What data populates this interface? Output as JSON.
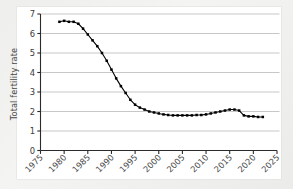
{
  "chart_data": {
    "type": "line",
    "title": "",
    "xlabel": "",
    "ylabel": "Total fertility rate",
    "xlim": [
      1975,
      2025
    ],
    "ylim": [
      0,
      7
    ],
    "grid": true,
    "grid_axis": "y",
    "legend_position": "none",
    "marker": "square",
    "marker_color": "#000000",
    "line_color": "#000000",
    "xticks": [
      1975,
      1980,
      1985,
      1990,
      1995,
      2000,
      2005,
      2010,
      2015,
      2020,
      2025
    ],
    "xtick_labels": [
      "1975",
      "1980",
      "1985",
      "1990",
      "1995",
      "2000",
      "2005",
      "2010",
      "2015",
      "2020",
      "2025"
    ],
    "yticks": [
      0,
      1,
      2,
      3,
      4,
      5,
      6,
      7
    ],
    "ytick_labels": [
      "0",
      "1",
      "2",
      "3",
      "4",
      "5",
      "6",
      "7"
    ],
    "x": [
      1979,
      1980,
      1981,
      1982,
      1983,
      1984,
      1985,
      1986,
      1987,
      1988,
      1989,
      1990,
      1991,
      1992,
      1993,
      1994,
      1995,
      1996,
      1997,
      1998,
      1999,
      2000,
      2001,
      2002,
      2003,
      2004,
      2005,
      2006,
      2007,
      2008,
      2009,
      2010,
      2011,
      2012,
      2013,
      2014,
      2015,
      2016,
      2017,
      2018,
      2019,
      2020,
      2021,
      2022
    ],
    "values": [
      6.6,
      6.65,
      6.6,
      6.6,
      6.5,
      6.25,
      5.95,
      5.65,
      5.35,
      5.0,
      4.6,
      4.15,
      3.7,
      3.3,
      2.95,
      2.6,
      2.35,
      2.2,
      2.1,
      2.0,
      1.95,
      1.9,
      1.85,
      1.82,
      1.8,
      1.8,
      1.8,
      1.8,
      1.8,
      1.82,
      1.82,
      1.85,
      1.9,
      1.95,
      2.0,
      2.05,
      2.1,
      2.1,
      2.05,
      1.8,
      1.75,
      1.75,
      1.72,
      1.72
    ]
  },
  "axis": {
    "ylabel": "Total fertility rate"
  }
}
